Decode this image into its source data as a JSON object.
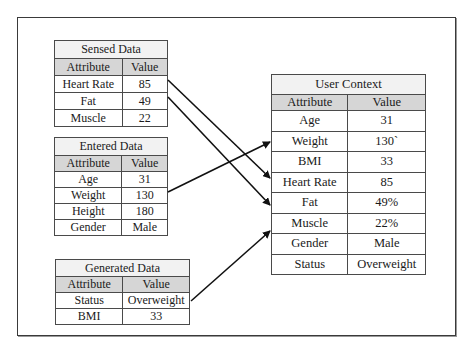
{
  "sensed": {
    "title": "Sensed Data",
    "headers": [
      "Attribute",
      "Value"
    ],
    "rows": [
      {
        "attribute": "Heart Rate",
        "value": "85"
      },
      {
        "attribute": "Fat",
        "value": "49"
      },
      {
        "attribute": "Muscle",
        "value": "22"
      }
    ]
  },
  "entered": {
    "title": "Entered Data",
    "headers": [
      "Attribute",
      "Value"
    ],
    "rows": [
      {
        "attribute": "Age",
        "value": "31"
      },
      {
        "attribute": "Weight",
        "value": "130"
      },
      {
        "attribute": "Height",
        "value": "180"
      },
      {
        "attribute": "Gender",
        "value": "Male"
      }
    ]
  },
  "generated": {
    "title": "Generated Data",
    "headers": [
      "Attribute",
      "Value"
    ],
    "rows": [
      {
        "attribute": "Status",
        "value": "Overweight"
      },
      {
        "attribute": "BMI",
        "value": "33"
      }
    ]
  },
  "context": {
    "title": "User Context",
    "headers": [
      "Attribute",
      "Value"
    ],
    "rows": [
      {
        "attribute": "Age",
        "value": "31"
      },
      {
        "attribute": "Weight",
        "value": "130`"
      },
      {
        "attribute": "BMI",
        "value": "33"
      },
      {
        "attribute": "Heart Rate",
        "value": "85"
      },
      {
        "attribute": "Fat",
        "value": "49%"
      },
      {
        "attribute": "Muscle",
        "value": "22%"
      },
      {
        "attribute": "Gender",
        "value": "Male"
      },
      {
        "attribute": "Status",
        "value": "Overweight"
      }
    ]
  },
  "arrows": [
    {
      "from": "sensed.Heart Rate",
      "to": "context.Heart Rate"
    },
    {
      "from": "sensed.Fat",
      "to": "context.Fat"
    },
    {
      "from": "entered.Weight",
      "to": "context.Weight"
    },
    {
      "from": "generated.Status",
      "to": "context.Muscle"
    }
  ],
  "colors": {
    "line": "#111111",
    "header_bg": "#d6d6d6",
    "title_bg": "#f2f2f2",
    "border": "#4a4a4a"
  }
}
